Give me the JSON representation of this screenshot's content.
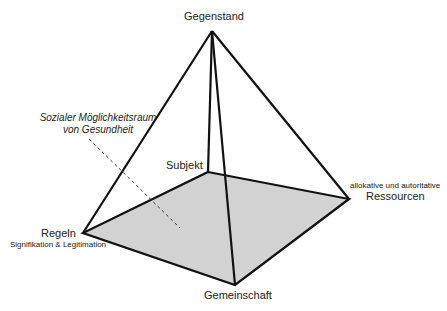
{
  "diagram": {
    "type": "pyramid",
    "apex": {
      "label": "Gegenstand"
    },
    "base_vertices": {
      "back": {
        "label": "Subjekt"
      },
      "left": {
        "label": "Regeln",
        "sublabel": "Signifikation & Legitimation"
      },
      "right": {
        "label": "Ressourcen",
        "sublabel": "allokative und autoritative"
      },
      "front": {
        "label": "Gemeinschaft"
      }
    },
    "annotation": {
      "line1": "Sozialer Möglichkeitsraum",
      "line2": "von Gesundheit"
    },
    "colors": {
      "edge": "#111111",
      "base_fill": "#d2d2d2",
      "background": "#ffffff"
    }
  }
}
